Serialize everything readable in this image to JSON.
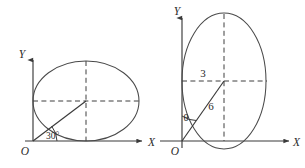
{
  "figure": {
    "background_color": "#ffffff",
    "stroke_color": "#3a3a3a",
    "width": 305,
    "height": 168
  },
  "panels": [
    {
      "id": "left-panel",
      "name": "horizontal-ellipse-diagram",
      "axes": {
        "y_label": "Y",
        "x_label": "X",
        "origin_label": "O"
      },
      "ellipse": {
        "orientation": "horizontal",
        "center_x": 86,
        "center_y": 101,
        "semi_major": 53,
        "semi_minor": 40
      },
      "annotations": {
        "angle_label": "30°",
        "angle_degrees": 30
      }
    },
    {
      "id": "right-panel",
      "name": "vertical-ellipse-diagram",
      "axes": {
        "y_label": "Y",
        "x_label": "X",
        "origin_label": "O"
      },
      "ellipse": {
        "orientation": "vertical",
        "center_x": 224,
        "center_y": 81,
        "semi_major": 68,
        "semi_minor": 42
      },
      "annotations": {
        "horizontal_segment_label": "3",
        "radius_label": "6",
        "angle_label": "θ"
      }
    }
  ]
}
